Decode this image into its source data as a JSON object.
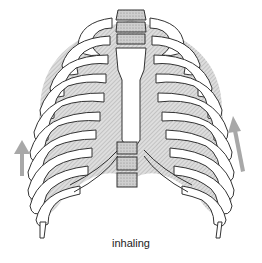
{
  "figure": {
    "caption": "inhaling",
    "arrows": [
      {
        "name": "left-arrow",
        "direction": "up"
      },
      {
        "name": "right-arrow",
        "direction": "up"
      }
    ],
    "colors": {
      "background": "#ffffff",
      "line": "#333333",
      "bone_fill": "#ffffff",
      "shading": "#b8b8b8",
      "vertebra": "#c8c8c8",
      "arrow": "#a8a8a8"
    }
  }
}
